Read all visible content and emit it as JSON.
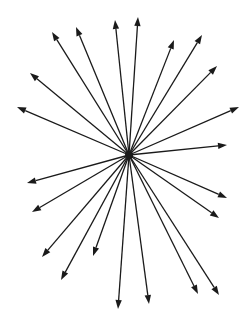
{
  "diagram": {
    "type": "radial-arrow-burst",
    "background": "#ffffff",
    "stroke_color": "#1a1a1a",
    "stroke_width": 1.3,
    "center": {
      "x": 129,
      "y": 155
    },
    "arrows": [
      {
        "x": 115,
        "y": 20
      },
      {
        "x": 138,
        "y": 17
      },
      {
        "x": 76,
        "y": 27
      },
      {
        "x": 52,
        "y": 32
      },
      {
        "x": 30,
        "y": 73
      },
      {
        "x": 17,
        "y": 107
      },
      {
        "x": 174,
        "y": 40
      },
      {
        "x": 202,
        "y": 35
      },
      {
        "x": 217,
        "y": 66
      },
      {
        "x": 239,
        "y": 107
      },
      {
        "x": 227,
        "y": 145
      },
      {
        "x": 27,
        "y": 183
      },
      {
        "x": 32,
        "y": 212
      },
      {
        "x": 42,
        "y": 257
      },
      {
        "x": 61,
        "y": 280
      },
      {
        "x": 93,
        "y": 256
      },
      {
        "x": 118,
        "y": 309
      },
      {
        "x": 149,
        "y": 304
      },
      {
        "x": 198,
        "y": 294
      },
      {
        "x": 219,
        "y": 295
      },
      {
        "x": 227,
        "y": 198
      },
      {
        "x": 219,
        "y": 218
      }
    ]
  }
}
